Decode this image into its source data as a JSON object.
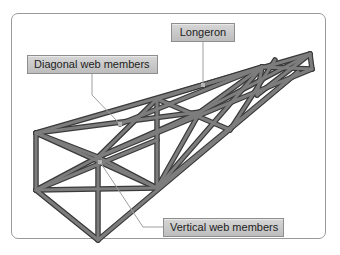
{
  "figure": {
    "labels": {
      "longeron": "Longeron",
      "diagonal_web_members": "Diagonal web members",
      "vertical_web_members": "Vertical web members"
    },
    "colors": {
      "frame_border": "#9a9a9a",
      "label_fill": "#c9c9c9",
      "label_border": "#8e8e8e",
      "member_fill": "#7a7a7a",
      "member_outline": "#3a3a3a",
      "leader_line": "#9c9c9c"
    }
  }
}
